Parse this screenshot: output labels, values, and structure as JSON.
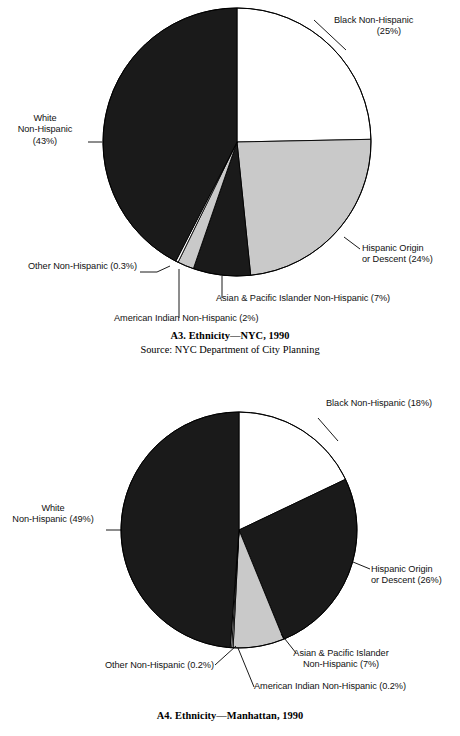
{
  "page": {
    "background": "#ffffff",
    "width": 460,
    "height": 736
  },
  "colors": {
    "black_fill": "#1a1a1a",
    "white_fill": "#ffffff",
    "gray_fill": "#c9c9c9",
    "outline": "#000000",
    "text": "#111111"
  },
  "figures": [
    {
      "id": "A3",
      "caption_title": "A3. Ethnicity—NYC, 1990",
      "caption_source": "Source: NYC Department of City Planning",
      "labels": {
        "black": "Black Non-Hispanic",
        "black_pct": "(25%)",
        "white_l1": "White",
        "white_l2": "Non-Hispanic",
        "white_pct": "(43%)",
        "hispanic_l1": "Hispanic Origin",
        "hispanic_l2": "or Descent (24%)",
        "asian": "Asian & Pacific Islander Non-Hispanic (7%)",
        "amerindian": "American Indian Non-Hispanic (2%)",
        "other": "Other Non-Hispanic (0.3%)"
      }
    },
    {
      "id": "A4",
      "caption_title": "A4. Ethnicity—Manhattan, 1990",
      "caption_source": "",
      "labels": {
        "black": "Black Non-Hispanic (18%)",
        "white_l1": "White",
        "white_l2": "Non-Hispanic (49%)",
        "hispanic_l1": "Hispanic Origin",
        "hispanic_l2": "or Descent (26%)",
        "asian_l1": "Asian & Pacific Islander",
        "asian_l2": "Non-Hispanic (7%)",
        "amerindian": "American Indian Non-Hispanic (0.2%)",
        "other": "Other Non-Hispanic (0.2%)"
      }
    }
  ],
  "chart_data": [
    {
      "type": "pie",
      "title": "A3. Ethnicity—NYC, 1990",
      "subtitle": "Source: NYC Department of City Planning",
      "legend_position": "callout-labels",
      "start_angle_deg": 0,
      "direction": "clockwise",
      "center": {
        "x": 237,
        "y": 142
      },
      "radius": 134,
      "categories": [
        "Black Non-Hispanic",
        "Hispanic Origin or Descent",
        "Asian & Pacific Islander Non-Hispanic",
        "American Indian Non-Hispanic",
        "Other Non-Hispanic",
        "White Non-Hispanic"
      ],
      "values": [
        25,
        24,
        7,
        2,
        0.3,
        43
      ],
      "value_labels": [
        "25%",
        "24%",
        "7%",
        "2%",
        "0.3%",
        "43%"
      ],
      "slice_fills": [
        "#ffffff",
        "#c9c9c9",
        "#1a1a1a",
        "#c9c9c9",
        "#ffffff",
        "#1a1a1a"
      ]
    },
    {
      "type": "pie",
      "title": "A4. Ethnicity—Manhattan, 1990",
      "subtitle": "",
      "legend_position": "callout-labels",
      "start_angle_deg": 0,
      "direction": "clockwise",
      "center": {
        "x": 239,
        "y": 160
      },
      "radius": 118,
      "categories": [
        "Black Non-Hispanic",
        "Hispanic Origin or Descent",
        "Asian & Pacific Islander Non-Hispanic",
        "American Indian Non-Hispanic",
        "Other Non-Hispanic",
        "White Non-Hispanic"
      ],
      "values": [
        18,
        26,
        7,
        0.2,
        0.2,
        49
      ],
      "value_labels": [
        "18%",
        "26%",
        "7%",
        "0.2%",
        "0.2%",
        "49%"
      ],
      "slice_fills": [
        "#ffffff",
        "#1a1a1a",
        "#c9c9c9",
        "#ffffff",
        "#ffffff",
        "#1a1a1a"
      ]
    }
  ]
}
